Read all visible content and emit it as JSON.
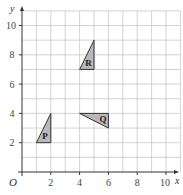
{
  "diagram": {
    "type": "coordinate-grid",
    "axes": {
      "x_label": "x",
      "y_label": "y",
      "origin_label": "O",
      "x_ticks": [
        "2",
        "4",
        "6",
        "8",
        "10"
      ],
      "y_ticks": [
        "2",
        "4",
        "6",
        "8",
        "10"
      ],
      "x_range": [
        0,
        11
      ],
      "y_range": [
        0,
        11
      ]
    },
    "shapes": [
      {
        "label": "P",
        "vertices": [
          [
            1,
            2
          ],
          [
            2,
            2
          ],
          [
            2,
            4
          ]
        ]
      },
      {
        "label": "Q",
        "vertices": [
          [
            4,
            4
          ],
          [
            6,
            4
          ],
          [
            6,
            3
          ]
        ]
      },
      {
        "label": "R",
        "vertices": [
          [
            4,
            7
          ],
          [
            5,
            7
          ],
          [
            5,
            9
          ]
        ]
      }
    ],
    "colors": {
      "shape_fill": "#b8b8b8",
      "grid": "#c8c8c8",
      "axis": "#333333"
    }
  }
}
